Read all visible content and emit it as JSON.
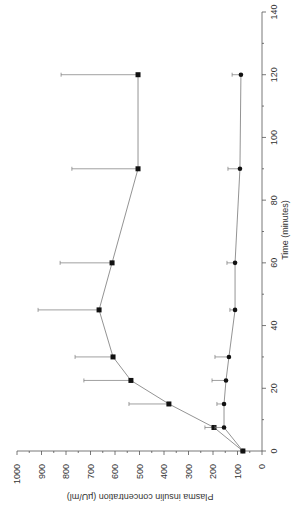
{
  "chart_data": {
    "type": "line",
    "orientation": "rotated 90 degrees (time axis vertical on right, insulin axis horizontal at bottom)",
    "title": "",
    "xlabel": "Time (minutes)",
    "ylabel": "Plasma insulin concentration (µU/ml)",
    "xlim": [
      0,
      140
    ],
    "ylim": [
      0,
      1000
    ],
    "x_ticks": [
      0,
      20,
      40,
      60,
      80,
      100,
      120,
      140
    ],
    "y_ticks": [
      0,
      100,
      200,
      300,
      400,
      500,
      600,
      700,
      800,
      900,
      1000
    ],
    "grid": false,
    "legend": null,
    "series": [
      {
        "name": "Squares",
        "marker": "square",
        "x": [
          0,
          7.5,
          15,
          22.5,
          30,
          45,
          60,
          90,
          120
        ],
        "values": [
          78,
          196,
          380,
          535,
          608,
          665,
          612,
          506,
          506
        ],
        "error_plus": [
          0,
          37,
          163,
          192,
          155,
          249,
          212,
          270,
          314
        ]
      },
      {
        "name": "Circles",
        "marker": "circle",
        "x": [
          0,
          7.5,
          15,
          22.5,
          30,
          45,
          60,
          90,
          120
        ],
        "values": [
          78,
          155,
          155,
          147,
          135,
          110,
          110,
          90,
          86
        ],
        "error_plus": [
          0,
          37,
          29,
          57,
          57,
          21,
          33,
          49,
          36
        ]
      }
    ]
  },
  "labels": {
    "xlabel": "Time (minutes)",
    "ylabel": "Plasma insulin concentration (µU/ml)"
  }
}
